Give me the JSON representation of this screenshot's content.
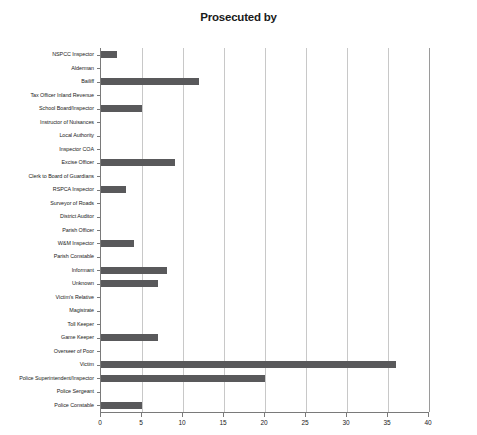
{
  "chart_data": {
    "type": "bar",
    "orientation": "horizontal",
    "title": "Prosecuted by",
    "xlabel": "",
    "ylabel": "",
    "xlim": [
      0,
      40
    ],
    "xticks": [
      0,
      5,
      10,
      15,
      20,
      25,
      30,
      35,
      40
    ],
    "grid": "vertical",
    "legend": "none",
    "bar_color": "#59595b",
    "categories": [
      "NSPCC Inspector",
      "Alderman",
      "Bailiff",
      "Tax Officer Inland Revenue",
      "School Board/Inspector",
      "Instructor of Nuisances",
      "Local Authority",
      "Inspector COA",
      "Excise Officer",
      "Clerk to Board of Guardians",
      "RSPCA Inspector",
      "Surveyor of Roads",
      "District Auditor",
      "Parish Officer",
      "W&M Inspector",
      "Parish Constable",
      "Informant",
      "Unknown",
      "Victim's Relative",
      "Magistrate",
      "Toll Keeper",
      "Game Keeper",
      "Overseer of Poor",
      "Victim",
      "Police Superintendent/Inspector",
      "Police Sergeant",
      "Police Constable"
    ],
    "values": [
      2,
      0,
      12,
      0,
      5,
      0,
      0,
      0,
      9,
      0,
      3,
      0,
      0,
      0,
      4,
      0,
      8,
      7,
      0,
      0,
      0,
      7,
      0,
      36,
      20,
      0,
      5
    ]
  }
}
